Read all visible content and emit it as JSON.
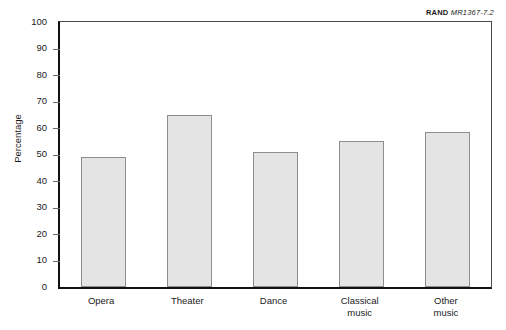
{
  "source_tag": {
    "organization": "RAND",
    "document_code": "MR1367-7.2"
  },
  "chart_data": {
    "type": "bar",
    "title": "",
    "xlabel": "",
    "ylabel": "Percentage",
    "categories": [
      "Opera",
      "Theater",
      "Dance",
      "Classical\nmusic",
      "Other\nmusic"
    ],
    "values": [
      49,
      65,
      51,
      55,
      58.5
    ],
    "ylim": [
      0,
      100
    ],
    "ytick_labels": [
      "100",
      "90",
      "80",
      "70",
      "60",
      "50",
      "40",
      "30",
      "20",
      "10",
      "0"
    ],
    "ytick_values": [
      100,
      90,
      80,
      70,
      60,
      50,
      40,
      30,
      20,
      10,
      0
    ],
    "grid": false,
    "legend": "none",
    "bar_fill_color": "#e4e4e4",
    "bar_border_color": "#8d8d8d",
    "axis_color": "#111111"
  }
}
